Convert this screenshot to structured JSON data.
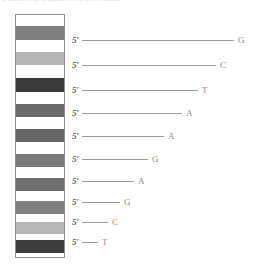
{
  "figure": {
    "type": "dna-sequencing-gel",
    "top_clipped_text": "a nucleotide sequence of a DNA strand",
    "background_color": "#ffffff",
    "lane": {
      "border_color": "#8d8d8d",
      "fill_color": "#ffffff",
      "x": 15,
      "y": 14,
      "width": 50,
      "height": 244,
      "bands": [
        {
          "index": 1,
          "top": 26,
          "height": 14,
          "color": "#7e7e7e",
          "shade": "medium-gray"
        },
        {
          "index": 2,
          "top": 52,
          "height": 13,
          "color": "#b6b6b6",
          "shade": "light-gray"
        },
        {
          "index": 3,
          "top": 78,
          "height": 14,
          "color": "#3a3a3a",
          "shade": "near-black"
        },
        {
          "index": 4,
          "top": 104,
          "height": 13,
          "color": "#6a6a6a",
          "shade": "dark-gray"
        },
        {
          "index": 5,
          "top": 129,
          "height": 13,
          "color": "#666666",
          "shade": "dark-gray"
        },
        {
          "index": 6,
          "top": 154,
          "height": 13,
          "color": "#7b7b7b",
          "shade": "medium-gray"
        },
        {
          "index": 7,
          "top": 178,
          "height": 13,
          "color": "#6e6e6e",
          "shade": "dark-gray"
        },
        {
          "index": 8,
          "top": 201,
          "height": 13,
          "color": "#808080",
          "shade": "medium-gray"
        },
        {
          "index": 9,
          "top": 222,
          "height": 12,
          "color": "#b9b9b9",
          "shade": "light-gray"
        },
        {
          "index": 10,
          "top": 240,
          "height": 13,
          "color": "#3d3d3d",
          "shade": "near-black"
        }
      ]
    },
    "five_prime_label": "5′",
    "rows": [
      {
        "index": 1,
        "top": 40,
        "line_length": 152,
        "base": "G"
      },
      {
        "index": 2,
        "top": 65,
        "line_length": 134,
        "base": "C"
      },
      {
        "index": 3,
        "top": 90,
        "line_length": 116,
        "base": "T"
      },
      {
        "index": 4,
        "top": 113,
        "line_length": 100,
        "base": "A"
      },
      {
        "index": 5,
        "top": 136,
        "line_length": 82,
        "base": "A"
      },
      {
        "index": 6,
        "top": 159,
        "line_length": 66,
        "base": "G"
      },
      {
        "index": 7,
        "top": 181,
        "line_length": 52,
        "base": "A"
      },
      {
        "index": 8,
        "top": 202,
        "line_length": 38,
        "base": "G"
      },
      {
        "index": 9,
        "top": 222,
        "line_length": 26,
        "base": "C"
      },
      {
        "index": 10,
        "top": 242,
        "line_length": 16,
        "base": "T"
      }
    ],
    "sequence_top_to_bottom": "G C T A A G A G C T"
  }
}
